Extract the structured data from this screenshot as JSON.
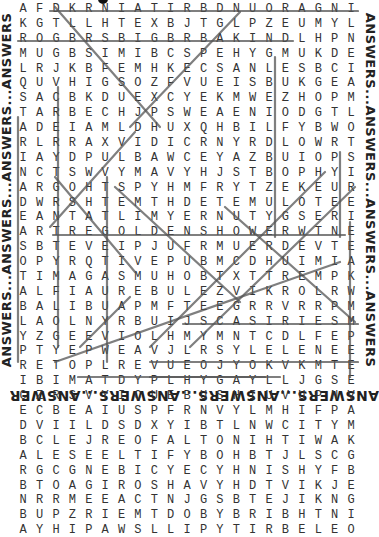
{
  "border_text": {
    "left": "ANSWERS...ANSWERS...ANSWERS...ANSWERS",
    "right": "ANSWERS...ANSWERS...ANSWERS...ANSWERS",
    "bottom": "ANSWERS...ANSWERS...ANSWERS...ANSWERS"
  },
  "grid": {
    "rows": [
      "AFDKRNIATIRBDNUORAGNIRBGORB",
      "KGTLLHTEXBJTGLPZEUMYLGVRSEL",
      "ROGBRSBIGBRBAKINDLHPNREFEJI",
      "MUGBSIMIBCSPEHYGMUKDEMILCSA",
      "LRJKBFEMHKECSANLESBCIMILHBF",
      "QUVHIGSOZFVUEISBUKGEAABIKJE",
      "SACBKDUEXCYEKMWEZHOPMWNPLAG",
      "TARBECHJPSWEAENIODGTLPMKYED",
      "ADEIAMLDHUXQHBILFYBWOMLABTL",
      "RLRRAXVIDICRNYRDLOWRTWBUWHG",
      "IAYDPULBAWCEYAZBUIOPSPPTDWX",
      "NCTSWVYMAVYHJSTBOPHYIPJEBHR",
      "ARGOHTSPYHMFRYTZEKEURRFILOV",
      "DWRSHTEMTHDETEMULOTEEEBIDSC",
      "EANTATLIMYERNUTYGSERIPGORTE",
      "ARTREGOLDENSHOWERWTNEMTEWRF",
      "SBTEVEIPJUFRMUERDEVTECBYEM",
      "OPYRQTIVEPUBMCDHUIMIAHPHDC",
      "TIMAGASMUHOBTXTTREMPKREAOAE",
      "ALFIAUREBULEZVIKROLRWCDLJDL",
      "BALIBUAPMFTEEGRRVRRPMEDCHDE",
      "LAOLNYRBUIJSCASIRIESMKLMIYTB",
      "YZGEEVIOLHMYMNTCDLFEPMAVNTR",
      "PTYEPWEAVJLRSYLELENEEEVIUEI",
      "RETOPLREVUEOJYOKVKMTENPMVBT",
      "IBIMATDYPLHYGAYLLJGSEEPLGT",
      "CZRSVYICUEBUSHIUVUPNVCUUCJS",
      "ECBEAIUSPFRNVYLMHIFPAECTNBH",
      "DVIILDSDXYIBTLNWCITYMIHYDPI",
      "BCLEJREOFALTONIHTIWAKENEEHT",
      "ALESEELTIFYBOHBTJLSCGIMYBUS",
      "RGCGNEBICYECYHNISHYFBULNNKU",
      "BTOAGIROSHAVYHDTVIKJEVEAMTC",
      "NRRMEEACTNJGSBTEJIKNGRYDOBK",
      "BUPZRIEMTDOBYBRIBHTNIKNUPSE",
      "AYHIPAWSLLIPYTIRBELEOAIQGPT"
    ]
  },
  "colors": {
    "letters": "#333333",
    "strike_lines": "#555555",
    "border_text": "#222222",
    "background": "#ffffff"
  }
}
